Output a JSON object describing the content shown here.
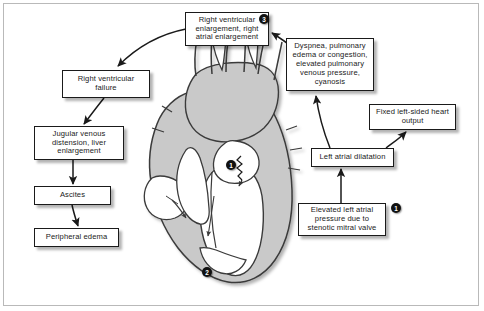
{
  "diagram": {
    "colors": {
      "box_border": "#1a1a1a",
      "box_fill": "#ffffff",
      "arrow": "#1a1a1a",
      "myocardium": "#c9c9c9",
      "chamber": "#ffffff",
      "vessel_outline": "#333333",
      "badge_fill": "#111111",
      "badge_text": "#ffffff",
      "frame": "#b9b9b9"
    },
    "boxes": [
      {
        "id": "rv-enlargement",
        "name": "right-ventricular-enlargement-box",
        "text": "Right ventricular enlargement, right atrial enlargement",
        "x": 185,
        "y": 12,
        "w": 84,
        "h": 34
      },
      {
        "id": "dyspnea",
        "name": "dyspnea-pulmonary-edema-box",
        "text": "Dyspnea, pulmonary edema or congestion, elevated pulmonary venous pressure, cyanosis",
        "x": 286,
        "y": 38,
        "w": 88,
        "h": 53
      },
      {
        "id": "rv-failure",
        "name": "right-ventricular-failure-box",
        "text": "Right ventricular failure",
        "x": 62,
        "y": 70,
        "w": 88,
        "h": 28
      },
      {
        "id": "fixed-output",
        "name": "fixed-left-sided-heart-output-box",
        "text": "Fixed left-sided heart output",
        "x": 369,
        "y": 104,
        "w": 87,
        "h": 26
      },
      {
        "id": "jvd",
        "name": "jugular-venous-distension-box",
        "text": "Jugular venous distension, liver enlargement",
        "x": 34,
        "y": 126,
        "w": 90,
        "h": 34
      },
      {
        "id": "la-dilatation",
        "name": "left-atrial-dilatation-box",
        "text": "Left atrial dilatation",
        "x": 311,
        "y": 148,
        "w": 83,
        "h": 19
      },
      {
        "id": "ascites",
        "name": "ascites-box",
        "text": "Ascites",
        "x": 34,
        "y": 186,
        "w": 77,
        "h": 19
      },
      {
        "id": "elevated-la-pressure",
        "name": "elevated-left-atrial-pressure-box",
        "text": "Elevated left atrial pressure due to stenotic mitral valve",
        "x": 298,
        "y": 203,
        "w": 88,
        "h": 33
      },
      {
        "id": "peripheral-edema",
        "name": "peripheral-edema-box",
        "text": "Peripheral edema",
        "x": 34,
        "y": 228,
        "w": 85,
        "h": 19
      }
    ],
    "badges": [
      {
        "id": "badge-3",
        "name": "step-badge-3",
        "label": "3",
        "x": 259,
        "y": 14
      },
      {
        "id": "badge-1-heart",
        "name": "step-badge-1-mitral-valve",
        "label": "1",
        "x": 226,
        "y": 160
      },
      {
        "id": "badge-1-box",
        "name": "step-badge-1-elevated-pressure",
        "label": "1",
        "x": 391,
        "y": 203
      },
      {
        "id": "badge-2-heart",
        "name": "step-badge-2-left-ventricle",
        "label": "2",
        "x": 202,
        "y": 267
      }
    ]
  }
}
